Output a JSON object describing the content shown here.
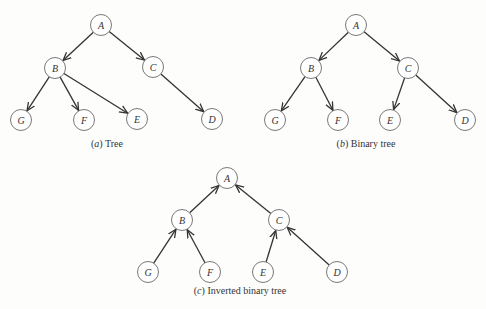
{
  "diagrams": [
    {
      "id": "a",
      "caption_letter": "(a)",
      "caption_text": " Tree",
      "nodes": [
        {
          "id": "A",
          "x": 101,
          "y": 25
        },
        {
          "id": "B",
          "x": 55,
          "y": 68
        },
        {
          "id": "C",
          "x": 153,
          "y": 67
        },
        {
          "id": "G",
          "x": 21,
          "y": 120
        },
        {
          "id": "F",
          "x": 84,
          "y": 120
        },
        {
          "id": "E",
          "x": 137,
          "y": 119
        },
        {
          "id": "D",
          "x": 212,
          "y": 119
        }
      ],
      "edges": [
        [
          "A",
          "B"
        ],
        [
          "A",
          "C"
        ],
        [
          "B",
          "G"
        ],
        [
          "B",
          "F"
        ],
        [
          "B",
          "E"
        ],
        [
          "C",
          "D"
        ]
      ],
      "caption_pos": {
        "x": 107,
        "y": 147
      }
    },
    {
      "id": "b",
      "caption_letter": "(b)",
      "caption_text": " Binary tree",
      "nodes": [
        {
          "id": "A",
          "x": 356,
          "y": 25
        },
        {
          "id": "B",
          "x": 311,
          "y": 68
        },
        {
          "id": "C",
          "x": 408,
          "y": 68
        },
        {
          "id": "G",
          "x": 275,
          "y": 120
        },
        {
          "id": "F",
          "x": 338,
          "y": 120
        },
        {
          "id": "E",
          "x": 390,
          "y": 120
        },
        {
          "id": "D",
          "x": 465,
          "y": 120
        }
      ],
      "edges": [
        [
          "A",
          "B"
        ],
        [
          "A",
          "C"
        ],
        [
          "B",
          "G"
        ],
        [
          "B",
          "F"
        ],
        [
          "C",
          "E"
        ],
        [
          "C",
          "D"
        ]
      ],
      "caption_pos": {
        "x": 366,
        "y": 147
      }
    },
    {
      "id": "c",
      "caption_letter": "(c)",
      "caption_text": " Inverted binary tree",
      "nodes": [
        {
          "id": "A",
          "x": 227,
          "y": 178
        },
        {
          "id": "B",
          "x": 182,
          "y": 220
        },
        {
          "id": "C",
          "x": 279,
          "y": 220
        },
        {
          "id": "G",
          "x": 148,
          "y": 272
        },
        {
          "id": "F",
          "x": 210,
          "y": 272
        },
        {
          "id": "E",
          "x": 263,
          "y": 272
        },
        {
          "id": "D",
          "x": 337,
          "y": 272
        }
      ],
      "edges": [
        [
          "B",
          "A"
        ],
        [
          "C",
          "A"
        ],
        [
          "G",
          "B"
        ],
        [
          "F",
          "B"
        ],
        [
          "E",
          "C"
        ],
        [
          "D",
          "C"
        ]
      ],
      "caption_pos": {
        "x": 240,
        "y": 294
      }
    }
  ],
  "style": {
    "node_radius": 10.5,
    "edge_color": "#333333",
    "node_stroke": "#6a6a6a"
  }
}
